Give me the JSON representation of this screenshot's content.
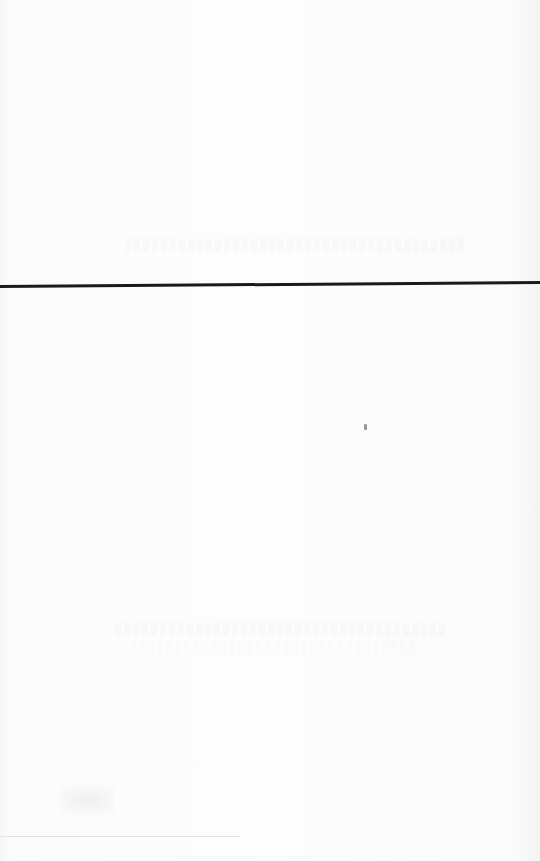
{
  "document": {
    "type": "scanned blank page",
    "visible_text": "",
    "elements": {
      "horizontal_rule": {
        "y": 287,
        "color": "#1a1a1a"
      },
      "bottom_rule": {
        "y": 836,
        "color": "#e2e2e2"
      },
      "background": "#fbfbfb"
    }
  }
}
